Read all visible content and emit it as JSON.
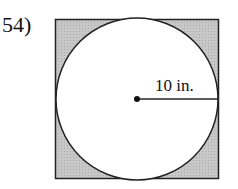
{
  "problem": {
    "number": "54)"
  },
  "figure": {
    "shape": "circle inscribed in square, shaded region outside circle",
    "radius_label": "10 in.",
    "colors": {
      "shade": "#c4c4c4",
      "stroke": "#222222",
      "circle_fill": "#ffffff"
    }
  }
}
